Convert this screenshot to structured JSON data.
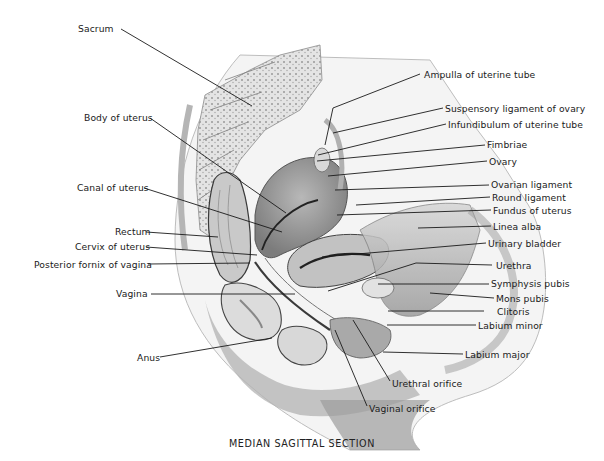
{
  "figure": {
    "caption": "MEDIAN SAGITTAL SECTION",
    "background": "#ffffff",
    "ink_color": "#1a1a1a"
  },
  "labels_left": [
    {
      "id": "sacrum",
      "text": "Sacrum",
      "x": 78,
      "y": 23,
      "line": [
        [
          121,
          29
        ],
        [
          252,
          106
        ]
      ]
    },
    {
      "id": "body-of-uterus",
      "text": "Body of uterus",
      "x": 84,
      "y": 112,
      "line": [
        [
          150,
          118
        ],
        [
          286,
          213
        ]
      ]
    },
    {
      "id": "canal-of-uterus",
      "text": "Canal of uterus",
      "x": 77,
      "y": 182,
      "line": [
        [
          144,
          188
        ],
        [
          282,
          232
        ]
      ]
    },
    {
      "id": "rectum",
      "text": "Rectum",
      "x": 115,
      "y": 226,
      "line": [
        [
          146,
          232
        ],
        [
          218,
          237
        ]
      ]
    },
    {
      "id": "cervix-of-uterus",
      "text": "Cervix of uterus",
      "x": 75,
      "y": 241,
      "line": [
        [
          146,
          247
        ],
        [
          257,
          255
        ]
      ]
    },
    {
      "id": "posterior-fornix-of-vagina",
      "text": "Posterior fornix of vagina",
      "x": 34,
      "y": 259,
      "line": [
        [
          148,
          264
        ],
        [
          250,
          263
        ]
      ]
    },
    {
      "id": "vagina",
      "text": "Vagina",
      "x": 116,
      "y": 288,
      "line": [
        [
          151,
          294
        ],
        [
          295,
          294
        ]
      ]
    },
    {
      "id": "anus",
      "text": "Anus",
      "x": 137,
      "y": 352,
      "line": [
        [
          160,
          357
        ],
        [
          272,
          338
        ]
      ]
    }
  ],
  "labels_right": [
    {
      "id": "ampulla-of-uterine-tube",
      "text": "Ampulla of uterine tube",
      "x": 424,
      "y": 69,
      "line": [
        [
          420,
          74
        ],
        [
          333,
          108
        ],
        [
          325,
          145
        ]
      ]
    },
    {
      "id": "suspensory-ligament-of-ovary",
      "text": "Suspensory ligament of ovary",
      "x": 445,
      "y": 103,
      "line": [
        [
          443,
          108
        ],
        [
          333,
          133
        ]
      ]
    },
    {
      "id": "infundibulum-of-uterine-tube",
      "text": "Infundibulum of uterine tube",
      "x": 448,
      "y": 119,
      "line": [
        [
          446,
          124
        ],
        [
          318,
          155
        ]
      ]
    },
    {
      "id": "fimbriae",
      "text": "Fimbriae",
      "x": 487,
      "y": 139,
      "line": [
        [
          485,
          145
        ],
        [
          317,
          161
        ]
      ]
    },
    {
      "id": "ovary",
      "text": "Ovary",
      "x": 489,
      "y": 156,
      "line": [
        [
          487,
          161
        ],
        [
          328,
          176
        ]
      ]
    },
    {
      "id": "ovarian-ligament",
      "text": "Ovarian ligament",
      "x": 491,
      "y": 179,
      "line": [
        [
          489,
          185
        ],
        [
          335,
          190
        ]
      ]
    },
    {
      "id": "round-ligament",
      "text": "Round ligament",
      "x": 492,
      "y": 192,
      "line": [
        [
          490,
          197
        ],
        [
          356,
          205
        ]
      ]
    },
    {
      "id": "fundus-of-uterus",
      "text": "Fundus of uterus",
      "x": 493,
      "y": 205,
      "line": [
        [
          491,
          210
        ],
        [
          337,
          215
        ]
      ]
    },
    {
      "id": "linea-alba",
      "text": "Linea alba",
      "x": 493,
      "y": 221,
      "line": [
        [
          491,
          226
        ],
        [
          418,
          228
        ]
      ]
    },
    {
      "id": "urinary-bladder",
      "text": "Urinary bladder",
      "x": 488,
      "y": 238,
      "line": [
        [
          486,
          243
        ],
        [
          322,
          257
        ]
      ]
    },
    {
      "id": "urethra",
      "text": "Urethra",
      "x": 496,
      "y": 260,
      "line": [
        [
          492,
          265
        ],
        [
          416,
          263
        ],
        [
          328,
          291
        ]
      ]
    },
    {
      "id": "symphysis-pubis",
      "text": "Symphysis pubis",
      "x": 491,
      "y": 278,
      "line": [
        [
          489,
          284
        ],
        [
          378,
          284
        ]
      ]
    },
    {
      "id": "mons-pubis",
      "text": "Mons pubis",
      "x": 496,
      "y": 293,
      "line": [
        [
          494,
          298
        ],
        [
          430,
          293
        ]
      ]
    },
    {
      "id": "clitoris",
      "text": "Clitoris",
      "x": 497,
      "y": 306,
      "line": [
        [
          484,
          311
        ],
        [
          388,
          311
        ]
      ]
    },
    {
      "id": "labium-minor",
      "text": "Labium minor",
      "x": 478,
      "y": 320,
      "line": [
        [
          476,
          325
        ],
        [
          387,
          325
        ]
      ]
    },
    {
      "id": "labium-major",
      "text": "Labium major",
      "x": 465,
      "y": 349,
      "line": [
        [
          463,
          354
        ],
        [
          383,
          352
        ]
      ]
    },
    {
      "id": "urethral-orifice",
      "text": "Urethral orifice",
      "x": 392,
      "y": 378,
      "line": [
        [
          390,
          381
        ],
        [
          353,
          320
        ]
      ]
    },
    {
      "id": "vaginal-orifice",
      "text": "Vaginal orifice",
      "x": 369,
      "y": 403,
      "line": [
        [
          367,
          406
        ],
        [
          335,
          330
        ]
      ]
    }
  ]
}
